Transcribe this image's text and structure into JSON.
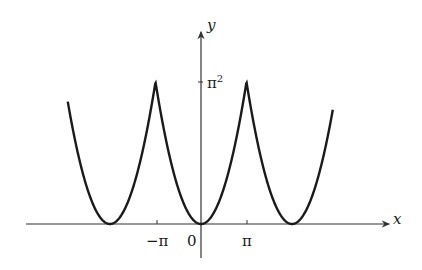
{
  "chart_data": {
    "type": "line",
    "title": "",
    "xlabel": "x",
    "ylabel": "y",
    "x_tick_labels": [
      "−π",
      "0",
      "π"
    ],
    "x_tick_values": [
      -3.14159,
      0,
      3.14159
    ],
    "y_tick_labels": [
      "π²"
    ],
    "y_tick_values": [
      9.8696
    ],
    "xlim": [
      -13.2,
      11.3
    ],
    "ylim": [
      -2.4,
      12.9
    ],
    "grid": false,
    "legend": null,
    "series": [
      {
        "name": "f(x) = x² (2π-periodic)",
        "domain": [
          -9.2,
          9.1
        ],
        "period": 6.28319,
        "peaks_x": [
          -9.42478,
          -3.14159,
          3.14159,
          9.42478
        ],
        "peak_y": 9.8696,
        "minima_x": [
          -6.28319,
          0,
          6.28319
        ],
        "minimum_y": 0
      }
    ]
  },
  "labels": {
    "x_axis": "x",
    "y_axis": "y",
    "tick_neg_pi": "−π",
    "tick_zero": "0",
    "tick_pi": "π",
    "tick_pi_sq_base": "π",
    "tick_pi_sq_exp": "2"
  },
  "colors": {
    "curve": "#1a1a1a",
    "axes": "#333333",
    "background": "#ffffff"
  }
}
